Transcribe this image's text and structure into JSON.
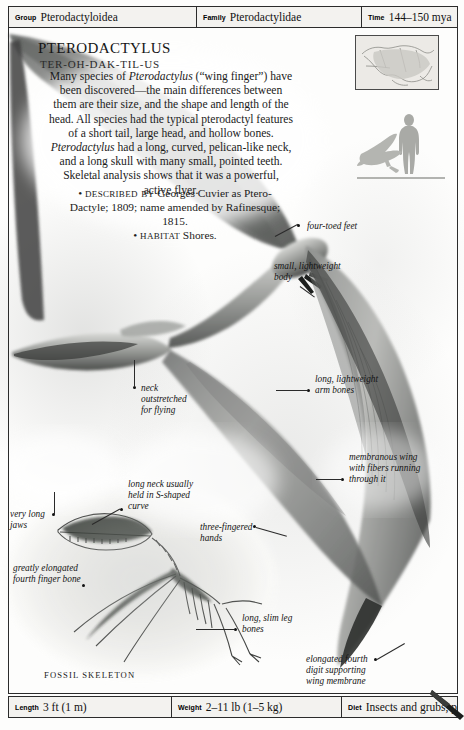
{
  "header": {
    "fields": [
      {
        "label": "Group",
        "value": "Pterodactyloidea"
      },
      {
        "label": "Family",
        "value": "Pterodactylidae"
      },
      {
        "label": "Time",
        "value": "144–150 mya"
      }
    ]
  },
  "title": "Pterodactylus",
  "pronunciation": "TER-OH-DAK-TIL-US",
  "description": "Many species of Pterodactylus (“wing finger”) have been discovered—the main differences between them are their size, and the shape and length of the head. All species had the typical pterodactyl features of a short tail, large head, and hollow bones. Pterodactylus had a long, curved, pelican-like neck, and a long skull with many small, pointed teeth. Skeletal analysis shows that it was a powerful, active flyer.",
  "facts": [
    {
      "term": "Described by",
      "text": "Georges Cuvier as Ptero-Dactyle; 1809; name amended by Rafinesque; 1815."
    },
    {
      "term": "Habitat",
      "text": "Shores."
    }
  ],
  "annotations": [
    {
      "id": "four-toed-feet",
      "text": "four-toed feet"
    },
    {
      "id": "small-body",
      "text": "small, lightweight\nbody"
    },
    {
      "id": "arm-bones",
      "text": "long, lightweight\narm bones"
    },
    {
      "id": "membranous-wing",
      "text": "membranous wing\nwith fibers running\nthrough it"
    },
    {
      "id": "neck-outstretched",
      "text": "neck\noutstretched\nfor flying"
    },
    {
      "id": "s-shaped-neck",
      "text": "long neck usually\nheld in S-shaped\ncurve"
    },
    {
      "id": "three-fingered-hands",
      "text": "three-fingered\nhands"
    },
    {
      "id": "very-long-jaws",
      "text": "very long\njaws"
    },
    {
      "id": "fourth-finger-bone",
      "text": "greatly elongated\nfourth finger bone"
    },
    {
      "id": "leg-bones",
      "text": "long, slim leg\nbones"
    },
    {
      "id": "fourth-digit",
      "text": "elongated fourth\ndigit supporting\nwing membrane"
    }
  ],
  "fossil_caption": "FOSSIL SKELETON",
  "footer": {
    "fields": [
      {
        "label": "Length",
        "value": "3 ft (1 m)"
      },
      {
        "label": "Weight",
        "value": "2–11 lb (1–5 kg)"
      },
      {
        "label": "Diet",
        "value": "Insects and grubs, perhaps carrion"
      }
    ]
  },
  "thumbnails": {
    "map_alt": "fossil-distribution-map",
    "scale_alt": "size-comparison-human-and-pterodactylus"
  },
  "colors": {
    "rule": "#2b2b2b",
    "bar_fill": "#f3f2ef",
    "text": "#1b1b1b"
  }
}
